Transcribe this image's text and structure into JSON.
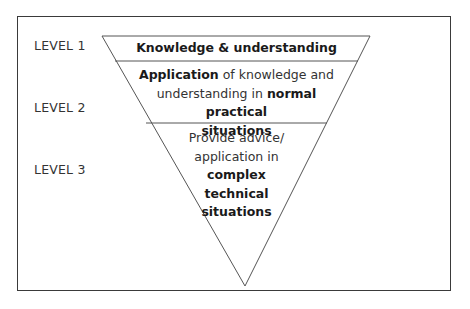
{
  "diagram": {
    "type": "inverted-pyramid",
    "levels": [
      {
        "label": "LEVEL 1",
        "text_segments": [
          {
            "text": "Knowledge & understanding",
            "bold": true
          }
        ]
      },
      {
        "label": "LEVEL 2",
        "text_segments": [
          {
            "text": "Application",
            "bold": true
          },
          {
            "text": " of knowledge and understanding in ",
            "bold": false
          },
          {
            "text": "normal practical situations",
            "bold": true
          }
        ]
      },
      {
        "label": "LEVEL 3",
        "text_segments": [
          {
            "text": "Provide advice/ application in ",
            "bold": false
          },
          {
            "text": "complex technical situations",
            "bold": true
          }
        ]
      }
    ],
    "colors": {
      "line": "#555555",
      "frame": "#3a3a3a",
      "text": "#333333",
      "background": "#ffffff"
    }
  },
  "labels": {
    "level1": "LEVEL 1",
    "level2": "LEVEL 2",
    "level3": "LEVEL 3"
  },
  "tiers": {
    "t1": {
      "b1": "Knowledge & understanding"
    },
    "t2": {
      "b1": "Application",
      "n1": " of knowledge and",
      "n2": "understanding in ",
      "b2": "normal practical",
      "b3": "situations"
    },
    "t3": {
      "n1": "Provide advice/",
      "n2": "application in",
      "b1": "complex",
      "b2": "technical",
      "b3": "situations"
    }
  }
}
